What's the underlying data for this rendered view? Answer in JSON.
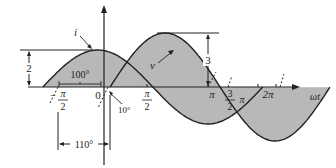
{
  "diagram": {
    "type": "phasor-waveform",
    "curves": [
      {
        "name": "i",
        "label": "i",
        "amplitude": 2,
        "amplitude_label": "2",
        "phase_label": "100°",
        "color": "#222222",
        "fill": "#b8b8b8"
      },
      {
        "name": "v",
        "label": "v",
        "amplitude": 3,
        "amplitude_label": "3",
        "phase_label": "10°",
        "color": "#222222",
        "fill": "#b8b8b8"
      }
    ],
    "x_axis_label": "ωt",
    "origin_label": "0",
    "ticks": [
      {
        "num": "π",
        "den": "2",
        "neg": true
      },
      {
        "num": "π",
        "den": "2",
        "neg": false
      },
      {
        "text": "π"
      },
      {
        "num": "3",
        "den": "2",
        "suffix": "π"
      },
      {
        "text": "2π"
      }
    ],
    "phase_difference_label": "110°"
  },
  "labels": {
    "i": "i",
    "v": "v",
    "amp_i": "2",
    "amp_v": "3",
    "phase_i": "100°",
    "phase_v": "10°",
    "phase_diff": "110°",
    "origin": "0",
    "xaxis": "ωt",
    "neg_minus": "−",
    "pi": "π",
    "two": "2",
    "three": "3",
    "pi_lbl": "π",
    "three_halves_pi_suffix": "π",
    "two_pi": "2π"
  },
  "colors": {
    "stroke": "#222222",
    "fill": "#b8b8b8",
    "background": "#ffffff"
  }
}
